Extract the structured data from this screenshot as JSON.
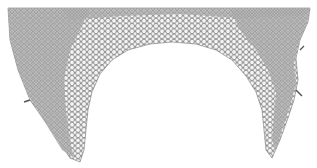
{
  "figure": {
    "colors": {
      "background": "#ffffff",
      "ink": "#6a6a6a",
      "dense_ink": "#8a8a8a",
      "cell_fill": "#f4f4f4"
    }
  }
}
